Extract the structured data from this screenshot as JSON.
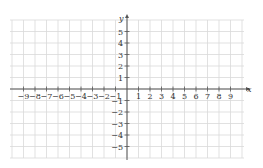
{
  "chart_data": {
    "type": "coordinate-grid",
    "title": "",
    "xlabel": "x",
    "ylabel": "y",
    "xlim": [
      -10,
      10
    ],
    "ylim": [
      -6,
      6
    ],
    "grid": true,
    "x_ticks": [
      -9,
      -8,
      -7,
      -6,
      -5,
      -4,
      -3,
      -2,
      -1,
      1,
      2,
      3,
      4,
      5,
      6,
      7,
      8,
      9
    ],
    "y_ticks": [
      -5,
      -4,
      -3,
      -2,
      -1,
      1,
      2,
      3,
      4,
      5
    ],
    "series": []
  },
  "colors": {
    "grid": "#d9d9d9",
    "axis": "#555555",
    "text": "#333333"
  }
}
